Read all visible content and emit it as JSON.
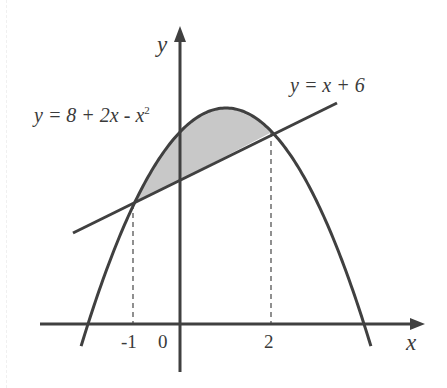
{
  "diagram": {
    "type": "area-between-curves",
    "colors": {
      "stroke": "#404040",
      "fill": "#c8c8c8",
      "dash": "#555555",
      "text": "#3a3a3a"
    },
    "axes": {
      "x_label": "x",
      "y_label": "y",
      "origin_label": "0"
    },
    "curves": [
      {
        "name": "parabola",
        "equation": "y = 8 + 2x - x²",
        "label_main": "y = 8 + 2x - x",
        "label_sup": "2"
      },
      {
        "name": "line",
        "equation": "y = x + 6",
        "label": "y = x + 6"
      }
    ],
    "intersections": [
      {
        "x": -1,
        "y": 5,
        "tick_label": "-1"
      },
      {
        "x": 2,
        "y": 8,
        "tick_label": "2"
      }
    ],
    "shaded_region": {
      "from_x": -1,
      "to_x": 2,
      "top": "y = 8 + 2x - x²",
      "bottom": "y = x + 6"
    }
  }
}
